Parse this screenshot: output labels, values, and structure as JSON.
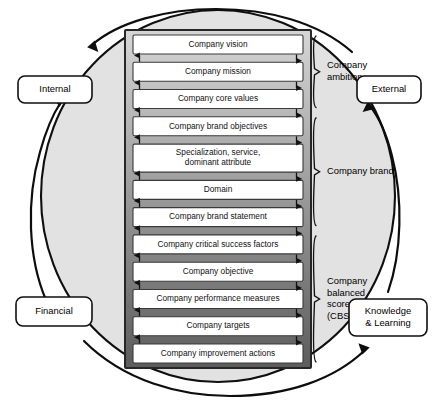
{
  "figure": {
    "background_color": "#ffffff",
    "circle_fill": "#e0e0e0",
    "circle_stroke": "#111111",
    "stack_outer_fill": "#6f6f6f",
    "box_fill": "#ffffff",
    "box_stroke": "#3a3a3a"
  },
  "stack": {
    "boxes": [
      {
        "id": "company-vision",
        "label": "Company vision",
        "lines": [
          "Company vision"
        ],
        "band_shade": "#cfcfcf"
      },
      {
        "id": "company-mission",
        "label": "Company mission",
        "lines": [
          "Company mission"
        ],
        "band_shade": "#c6c6c6"
      },
      {
        "id": "company-core-values",
        "label": "Company core values",
        "lines": [
          "Company core values"
        ],
        "band_shade": "#bcbcbc"
      },
      {
        "id": "company-brand-objectives",
        "label": "Company brand objectives",
        "lines": [
          "Company brand objectives"
        ],
        "band_shade": "#b2b2b2"
      },
      {
        "id": "specialization-service-dominant-attribute",
        "label": "Specialization, service, dominant attribute",
        "lines": [
          "Specialization, service,",
          "dominant attribute"
        ],
        "band_shade": "#a6a6a6"
      },
      {
        "id": "domain",
        "label": "Domain",
        "lines": [
          "Domain"
        ],
        "band_shade": "#9b9b9b"
      },
      {
        "id": "company-brand-statement",
        "label": "Company brand statement",
        "lines": [
          "Company brand statement"
        ],
        "band_shade": "#8f8f8f"
      },
      {
        "id": "company-critical-success-factors",
        "label": "Company critical success factors",
        "lines": [
          "Company critical success factors"
        ],
        "band_shade": "#848484"
      },
      {
        "id": "company-objective",
        "label": "Company objective",
        "lines": [
          "Company objective"
        ],
        "band_shade": "#7a7a7a"
      },
      {
        "id": "company-performance-measures",
        "label": "Company performance measures",
        "lines": [
          "Company performance measures"
        ],
        "band_shade": "#6e6e6e"
      },
      {
        "id": "company-targets",
        "label": "Company targets",
        "lines": [
          "Company targets"
        ],
        "band_shade": "#636363"
      },
      {
        "id": "company-improvement-actions",
        "label": "Company improvement actions",
        "lines": [
          "Company improvement actions"
        ],
        "band_shade": "#585858"
      }
    ],
    "connector": {
      "left_arrow_direction": "up",
      "right_arrow_direction": "down",
      "count": 11
    }
  },
  "groups": [
    {
      "id": "company-ambition",
      "lines": [
        "Company",
        "ambition"
      ],
      "label": "Company ambition",
      "from_box": "company-vision",
      "to_box": "company-core-values",
      "box_count": 3
    },
    {
      "id": "company-brand",
      "lines": [
        "Company brand"
      ],
      "label": "Company brand",
      "from_box": "company-brand-objectives",
      "to_box": "company-brand-statement",
      "box_count": 4
    },
    {
      "id": "company-balanced-scorecard",
      "lines": [
        "Company",
        "balanced",
        "scorecard",
        "(CBSC)"
      ],
      "label": "Company balanced scorecard (CBSC)",
      "from_box": "company-critical-success-factors",
      "to_box": "company-improvement-actions",
      "box_count": 5
    }
  ],
  "perspectives": [
    {
      "id": "internal",
      "lines": [
        "Internal"
      ],
      "label": "Internal",
      "position": "top-left"
    },
    {
      "id": "external",
      "lines": [
        "External"
      ],
      "label": "External",
      "position": "top-right"
    },
    {
      "id": "financial",
      "lines": [
        "Financial"
      ],
      "label": "Financial",
      "position": "bottom-left"
    },
    {
      "id": "knowledge-learning",
      "lines": [
        "Knowledge",
        "& Learning"
      ],
      "label": "Knowledge & Learning",
      "position": "bottom-right"
    }
  ],
  "cycle_arrows": [
    {
      "id": "external-to-internal",
      "from": "external",
      "to": "internal",
      "path": "top"
    },
    {
      "id": "financial-to-internal",
      "from": "financial",
      "to": "internal",
      "path": "left"
    },
    {
      "id": "financial-to-knowledge",
      "from": "financial",
      "to": "knowledge-learning",
      "path": "bottom"
    },
    {
      "id": "knowledge-to-external",
      "from": "knowledge-learning",
      "to": "external",
      "path": "right"
    }
  ]
}
